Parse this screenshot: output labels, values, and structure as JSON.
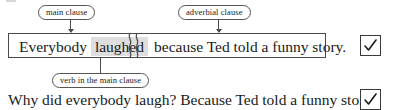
{
  "diagram": {
    "annotations": [
      {
        "id": "main-clause",
        "label": "main clause"
      },
      {
        "id": "adverbial-clause",
        "label": "adverbial clause"
      },
      {
        "id": "verb-in-main-clause",
        "label": "verb in the main clause"
      }
    ],
    "sentence": {
      "main_clause_prefix": "Everybody",
      "highlighted_verb": "laughed",
      "adverbial_clause": "because Ted told a funny story.",
      "divider_icon": "wavy-break-icon"
    },
    "bottom_sentence": "Why did everybody laugh? Because Ted told a funny story.",
    "marks": [
      {
        "id": "top",
        "icon": "check-icon",
        "state": "checked"
      },
      {
        "id": "bottom",
        "icon": "check-icon",
        "state": "checked"
      }
    ],
    "colors": {
      "highlight": "#dedede",
      "border": "#4a4a4a",
      "pill_border": "#555555",
      "text": "#1a1a1a",
      "background": "#ffffff"
    }
  }
}
